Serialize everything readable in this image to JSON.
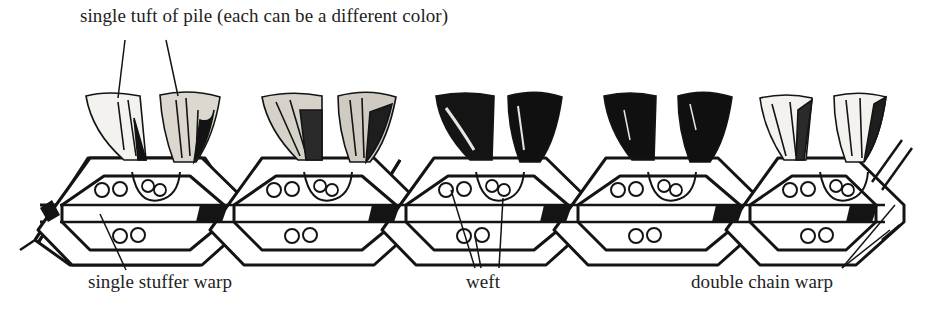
{
  "labels": {
    "tuft": "single tuft of pile (each can be a different color)",
    "stuffer": "single stuffer warp",
    "weft": "weft",
    "chain": "double chain warp"
  },
  "structure": {
    "cells": 5,
    "tufts_per_cell": 2,
    "wefts_per_cell_upper": 2,
    "wefts_per_cell_lower": 2,
    "tuft_shades": [
      [
        "light",
        "medium"
      ],
      [
        "medium",
        "medium"
      ],
      [
        "dark",
        "dark"
      ],
      [
        "dark",
        "dark"
      ],
      [
        "light",
        "light"
      ]
    ]
  },
  "colors": {
    "ink": "#141414",
    "paper": "#ffffff",
    "light_tuft": "#f4f2ee",
    "dark_tuft": "#101010"
  }
}
